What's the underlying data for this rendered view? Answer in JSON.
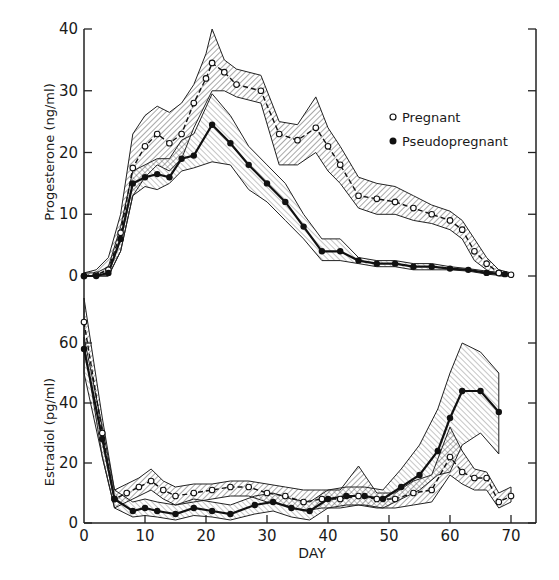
{
  "chart_data": [
    {
      "type": "line",
      "panel": "top",
      "title": "",
      "xlabel": "",
      "ylabel": "Progesterone (ng/ml)",
      "xlim": [
        0,
        74
      ],
      "ylim": [
        0,
        40
      ],
      "yticks": [
        0,
        10,
        20,
        30,
        40
      ],
      "ytick_labels": [
        "0",
        "10",
        "20",
        "30",
        "40"
      ],
      "legend": {
        "position": "top-right",
        "entries": [
          {
            "label": "Pregnant",
            "marker": "open-circle"
          },
          {
            "label": "Pseudopregnant",
            "marker": "filled-circle"
          }
        ]
      },
      "series": [
        {
          "name": "Pregnant",
          "marker": "open-circle",
          "style": "dashed",
          "x": [
            0,
            2,
            4,
            6,
            8,
            10,
            12,
            14,
            16,
            18,
            20,
            21,
            23,
            25,
            29,
            32,
            35,
            38,
            40,
            42,
            45,
            48,
            51,
            54,
            57,
            60,
            62,
            64,
            66,
            68,
            70
          ],
          "y": [
            0,
            0.2,
            1,
            7,
            17.5,
            21,
            23,
            21.5,
            23,
            28,
            32,
            34.5,
            33,
            31,
            30,
            23,
            22,
            24,
            21,
            18,
            13,
            12.5,
            12,
            11,
            10,
            9,
            7.5,
            4,
            2,
            0.5,
            0.2
          ],
          "upper": [
            0.5,
            1,
            3,
            10,
            23,
            26,
            27.5,
            26.5,
            28,
            31,
            36,
            40,
            35,
            33.5,
            32.5,
            25,
            24.5,
            29,
            24,
            21,
            16,
            15,
            14.5,
            13,
            11.5,
            10.5,
            9,
            6,
            3,
            1,
            0.5
          ],
          "lower": [
            0,
            0,
            0,
            4,
            13,
            16,
            18,
            17,
            19,
            24,
            28,
            30,
            30,
            29,
            28,
            18,
            18,
            20,
            17,
            15,
            11,
            10,
            10,
            9,
            8.5,
            7.5,
            6,
            2.5,
            1,
            0,
            0
          ]
        },
        {
          "name": "Pseudopregnant",
          "marker": "filled-circle",
          "style": "solid",
          "x": [
            0,
            2,
            4,
            6,
            8,
            10,
            12,
            14,
            16,
            18,
            21,
            24,
            27,
            30,
            33,
            36,
            39,
            42,
            45,
            48,
            51,
            54,
            57,
            60,
            63,
            66,
            69
          ],
          "y": [
            0,
            0,
            0.5,
            6,
            15,
            16,
            16.5,
            16,
            19,
            19.5,
            24.5,
            21.5,
            18,
            15,
            12,
            8,
            4,
            4,
            2.5,
            2,
            2,
            1.5,
            1.5,
            1.2,
            1,
            0.5,
            0.3
          ],
          "upper": [
            0.5,
            0.5,
            1.5,
            8,
            17,
            18,
            19,
            19,
            22,
            23,
            29.5,
            26,
            21,
            18,
            15,
            10,
            6,
            6,
            3,
            2.5,
            2.5,
            2,
            2,
            1.5,
            1.2,
            0.8,
            0.5
          ],
          "lower": [
            0,
            0,
            0,
            4,
            13,
            14.5,
            14,
            15,
            17,
            17.5,
            18.5,
            18,
            14,
            12,
            9,
            6,
            2.5,
            2.5,
            2,
            1.5,
            1.5,
            1,
            1,
            1,
            0.8,
            0.3,
            0
          ]
        }
      ]
    },
    {
      "type": "line",
      "panel": "bottom",
      "title": "",
      "xlabel": "DAY",
      "ylabel": "Estradiol (pg/ml)",
      "xlim": [
        0,
        74
      ],
      "ylim": [
        0,
        75
      ],
      "xticks": [
        0,
        10,
        20,
        30,
        40,
        50,
        60,
        70
      ],
      "xtick_labels": [
        "0",
        "10",
        "20",
        "30",
        "40",
        "50",
        "60",
        "70"
      ],
      "yticks": [
        0,
        20,
        40,
        60
      ],
      "ytick_labels": [
        "0",
        "20",
        "40",
        "60"
      ],
      "series": [
        {
          "name": "Pregnant",
          "marker": "open-circle",
          "style": "dashed",
          "x": [
            0,
            3,
            5,
            7,
            9,
            11,
            13,
            15,
            18,
            21,
            24,
            27,
            30,
            33,
            36,
            39,
            42,
            45,
            48,
            51,
            54,
            57,
            60,
            62,
            64,
            66,
            68,
            70
          ],
          "y": [
            67,
            30,
            8,
            10,
            12,
            14,
            11,
            9,
            10,
            11,
            12,
            12,
            10,
            9,
            7,
            8,
            8,
            9,
            8,
            8,
            10,
            11,
            22,
            17,
            15,
            15,
            7,
            9
          ],
          "upper": [
            75,
            35,
            11,
            13,
            15,
            18,
            14,
            12,
            13,
            13,
            14,
            14,
            13,
            12,
            11,
            11,
            11,
            19,
            10,
            10,
            14,
            16,
            32,
            24,
            18,
            17,
            10,
            12
          ],
          "lower": [
            60,
            22,
            5,
            7,
            9,
            11,
            8,
            6,
            7,
            8,
            9,
            9,
            7,
            6,
            4,
            5,
            5,
            6,
            5,
            5,
            6,
            7,
            16,
            13,
            11,
            11,
            5,
            7
          ]
        },
        {
          "name": "Pseudopregnant",
          "marker": "filled-circle",
          "style": "solid",
          "x": [
            0,
            3,
            5,
            8,
            10,
            12,
            15,
            18,
            21,
            24,
            28,
            31,
            34,
            37,
            40,
            43,
            46,
            49,
            52,
            55,
            58,
            60,
            62,
            65,
            68
          ],
          "y": [
            58,
            28,
            8,
            4,
            5,
            4,
            3,
            5,
            4,
            3,
            6,
            7,
            5,
            4,
            8,
            9,
            9,
            8,
            12,
            16,
            24,
            35,
            44,
            44,
            37
          ],
          "upper": [
            62,
            32,
            11,
            7,
            8,
            7,
            6,
            8,
            7,
            6,
            9,
            10,
            8,
            7,
            11,
            12,
            12,
            11,
            18,
            26,
            38,
            50,
            60,
            57,
            50
          ],
          "lower": [
            50,
            22,
            5,
            2,
            2.5,
            2,
            1,
            2.5,
            2,
            1,
            3,
            4,
            2,
            1,
            5,
            6,
            6,
            5,
            8,
            11,
            16,
            17,
            26,
            30,
            23
          ]
        }
      ]
    }
  ]
}
